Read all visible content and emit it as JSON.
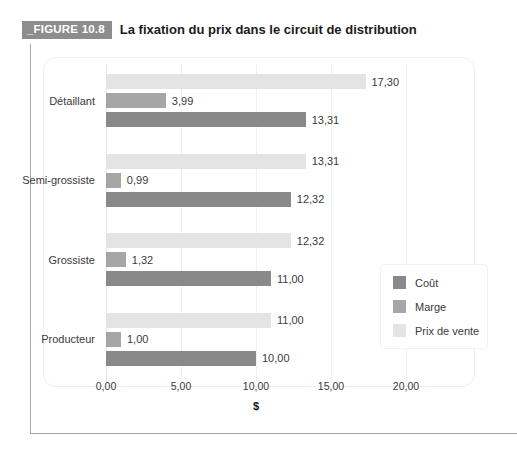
{
  "figure": {
    "badge": "_FIGURE 10.8",
    "title": "La fixation du prix dans le circuit de distribution"
  },
  "chart_data": {
    "type": "bar",
    "orientation": "horizontal",
    "title": "La fixation du prix dans le circuit de distribution",
    "xlabel": "$",
    "ylabel": "",
    "xlim": [
      0,
      20
    ],
    "xticks": [
      "0,00",
      "5,00",
      "10,00",
      "15,00",
      "20,00"
    ],
    "xtick_values": [
      0,
      5,
      10,
      15,
      20
    ],
    "grid": true,
    "legend_position": "right",
    "categories": [
      "Détaillant",
      "Semi-grossiste",
      "Grossiste",
      "Producteur"
    ],
    "series": [
      {
        "name": "Prix de vente",
        "color": "#e2e4e5",
        "values": [
          17.3,
          13.31,
          12.32,
          11.0
        ],
        "labels": [
          "17,30",
          "13,31",
          "12,32",
          "11,00"
        ]
      },
      {
        "name": "Marge",
        "color": "#a6a6a6",
        "values": [
          3.99,
          0.99,
          1.32,
          1.0
        ],
        "labels": [
          "3,99",
          "0,99",
          "1,32",
          "1,00"
        ]
      },
      {
        "name": "Coût",
        "color": "#898989",
        "values": [
          13.31,
          12.32,
          11.0,
          10.0
        ],
        "labels": [
          "13,31",
          "12,32",
          "11,00",
          "10,00"
        ]
      }
    ],
    "legend": [
      {
        "label": "Coût",
        "color": "#898989"
      },
      {
        "label": "Marge",
        "color": "#a6a6a6"
      },
      {
        "label": "Prix de vente",
        "color": "#e2e4e5"
      }
    ]
  }
}
